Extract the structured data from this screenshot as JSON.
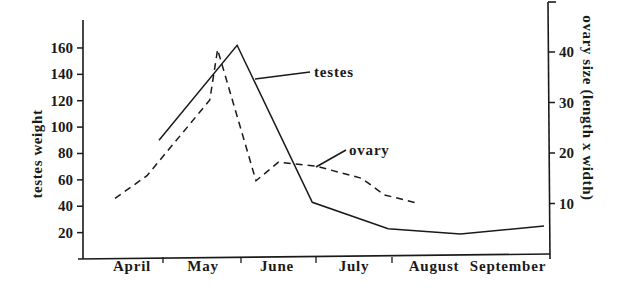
{
  "chart_data": {
    "type": "line",
    "title": "",
    "xlabel": "",
    "categories": [
      "April",
      "May",
      "June",
      "July",
      "August",
      "September"
    ],
    "y_left": {
      "label": "testes weight",
      "ticks": [
        20,
        40,
        60,
        80,
        100,
        120,
        140,
        160
      ],
      "range": [
        0,
        175
      ]
    },
    "y_right": {
      "label": "ovary size (length x width)",
      "ticks": [
        10,
        20,
        30,
        40
      ],
      "range": [
        0,
        50
      ]
    },
    "grid": false,
    "legend": "inline annotations",
    "series": [
      {
        "name": "testes",
        "axis": "left",
        "style": "solid",
        "points": [
          {
            "x": 0.95,
            "y": 90
          },
          {
            "x": 1.95,
            "y": 162
          },
          {
            "x": 2.95,
            "y": 43
          },
          {
            "x": 3.95,
            "y": 23
          },
          {
            "x": 4.9,
            "y": 19
          },
          {
            "x": 5.95,
            "y": 25
          }
        ]
      },
      {
        "name": "ovary",
        "axis": "right",
        "style": "dashed",
        "points": [
          {
            "x": 0.4,
            "y": 11
          },
          {
            "x": 0.8,
            "y": 15.5
          },
          {
            "x": 1.6,
            "y": 30.5
          },
          {
            "x": 1.7,
            "y": 40.5
          },
          {
            "x": 2.2,
            "y": 14.5
          },
          {
            "x": 2.5,
            "y": 18.2
          },
          {
            "x": 3.0,
            "y": 17.4
          },
          {
            "x": 3.6,
            "y": 15
          },
          {
            "x": 3.9,
            "y": 11.7
          },
          {
            "x": 4.3,
            "y": 10.2
          }
        ]
      }
    ],
    "annotations": [
      {
        "text": "testes",
        "target": "testes"
      },
      {
        "text": "ovary",
        "target": "ovary"
      }
    ]
  },
  "labels": {
    "y_left_title": "testes weight",
    "y_right_title": "ovary size (length x width)",
    "testes_label": "testes",
    "ovary_label": "ovary",
    "months": [
      "April",
      "May",
      "June",
      "July",
      "August",
      "September"
    ],
    "left_ticks": [
      "20",
      "40",
      "60",
      "80",
      "100",
      "120",
      "140",
      "160"
    ],
    "right_ticks": [
      "10",
      "20",
      "30",
      "40"
    ]
  }
}
